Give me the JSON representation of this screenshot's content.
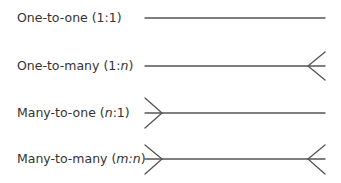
{
  "diagram": {
    "stroke_color": "#555555",
    "text_color": "#333333",
    "rows": [
      {
        "label_prefix": "One-to-one (1:1",
        "label_italic": "",
        "label_suffix": ")",
        "label_full": "One-to-one (1:1)",
        "left_end": "one",
        "right_end": "one"
      },
      {
        "label_prefix": "One-to-many (1:",
        "label_italic": "n",
        "label_suffix": ")",
        "label_full": "One-to-many (1:n)",
        "left_end": "one",
        "right_end": "many"
      },
      {
        "label_prefix": "Many-to-one (",
        "label_italic": "n",
        "label_suffix": ":1)",
        "label_full": "Many-to-one (n:1)",
        "left_end": "many",
        "right_end": "one"
      },
      {
        "label_prefix": "Many-to-many (",
        "label_italic": "m:n",
        "label_suffix": ")",
        "label_full": "Many-to-many (m:n)",
        "left_end": "many",
        "right_end": "many"
      }
    ]
  }
}
